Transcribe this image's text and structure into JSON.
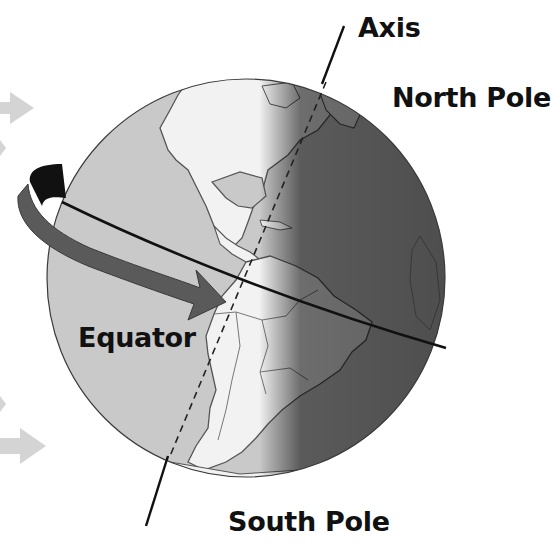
{
  "labels": {
    "axis": "Axis",
    "north_pole": "North Pole",
    "equator": "Equator",
    "south_pole": "South Pole"
  },
  "diagram": {
    "elements": [
      "sunlight-arrows",
      "globe-day-side",
      "globe-night-side",
      "equator-line",
      "rotation-arrow",
      "tilted-axis-line"
    ],
    "colors": {
      "day_ocean": "#c9c9c9",
      "day_land": "#f2f2f2",
      "night_ocean": "#4a4a4a",
      "night_land": "#6a6a6a",
      "rotation_arrow": "#5a5a5a",
      "rotation_arrow_back": "#111111",
      "sun_arrows": "#d4d4d4",
      "lines": "#111111"
    }
  }
}
